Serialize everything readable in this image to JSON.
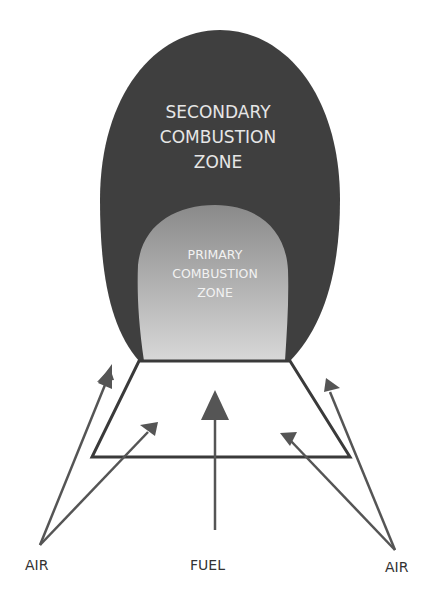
{
  "diagram": {
    "secondary_zone": {
      "lines": [
        "SECONDARY",
        "COMBUSTION",
        "ZONE"
      ],
      "color": "#3f3f3f",
      "text_color": "#e6e6e6"
    },
    "primary_zone": {
      "lines": [
        "PRIMARY",
        "COMBUSTION",
        "ZONE"
      ],
      "color_top": "#8a8a8a",
      "color_bottom": "#d6d6d6",
      "text_color": "#f2f2f2"
    },
    "burner": {
      "stroke": "#3a3a3a"
    },
    "arrow_color": "#555555",
    "labels": {
      "air_left": "AIR",
      "fuel": "FUEL",
      "air_right": "AIR"
    }
  }
}
